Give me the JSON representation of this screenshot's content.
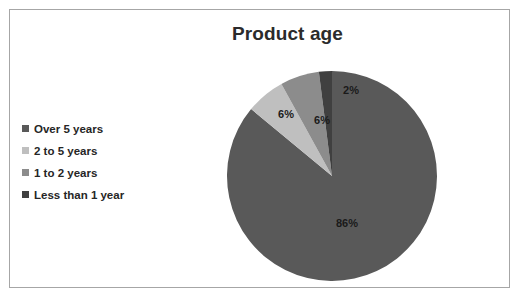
{
  "chart": {
    "title": "Product age",
    "border_color": "#a6a6a6",
    "background": "#ffffff"
  },
  "legend": {
    "items": [
      {
        "label": "Over 5 years",
        "color": "#595959"
      },
      {
        "label": "2 to 5 years",
        "color": "#bfbfbf"
      },
      {
        "label": "1 to 2 years",
        "color": "#8c8c8c"
      },
      {
        "label": "Less than 1 year",
        "color": "#404040"
      }
    ]
  },
  "chart_data": {
    "type": "pie",
    "title": "Product age",
    "xlabel": "",
    "ylabel": "",
    "categories": [
      "Over 5 years",
      "2 to 5 years",
      "1 to 2 years",
      "Less than 1 year"
    ],
    "values": [
      86,
      6,
      6,
      2
    ],
    "data_labels": [
      "86%",
      "6%",
      "6%",
      "2%"
    ],
    "colors": [
      "#595959",
      "#bfbfbf",
      "#8c8c8c",
      "#404040"
    ],
    "legend_position": "left",
    "start_angle_deg": 0,
    "direction": "clockwise",
    "grid": false,
    "slices": [
      {
        "name": "Over 5 years",
        "value": 86,
        "label": "86%",
        "color": "#595959",
        "label_x": 129,
        "label_y": 165
      },
      {
        "name": "2 to 5 years",
        "value": 6,
        "label": "6%",
        "color": "#bfbfbf",
        "label_x": 68,
        "label_y": 56
      },
      {
        "name": "1 to 2 years",
        "value": 6,
        "label": "6%",
        "color": "#8c8c8c",
        "label_x": 104,
        "label_y": 62
      },
      {
        "name": "Less than 1 year",
        "value": 2,
        "label": "2%",
        "color": "#404040",
        "label_x": 133,
        "label_y": 32
      }
    ]
  }
}
